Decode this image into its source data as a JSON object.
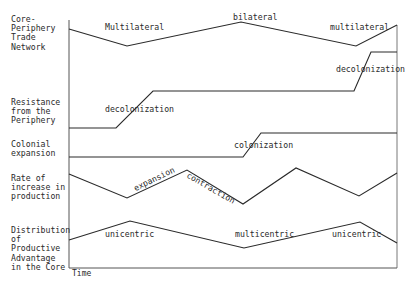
{
  "rows": [
    {
      "label": "Core-\nPeriphery\nTrade\nNetwork",
      "top": 15,
      "points": [
        [
          69,
          29
        ],
        [
          127,
          46
        ],
        [
          241,
          22
        ],
        [
          356,
          46
        ],
        [
          397,
          25
        ]
      ],
      "annotations": [
        {
          "text": "Multilateral",
          "x": 105,
          "y": 22,
          "rotate": 0
        },
        {
          "text": "bilateral",
          "x": 233,
          "y": 12,
          "rotate": 0
        },
        {
          "text": "multilateral",
          "x": 330,
          "y": 22,
          "rotate": 0
        }
      ]
    },
    {
      "label": "Resistance\nfrom the\nPeriphery",
      "top": 98,
      "points": [
        [
          69,
          128
        ],
        [
          116,
          128
        ],
        [
          153,
          91
        ],
        [
          354,
          91
        ],
        [
          371,
          52
        ],
        [
          397,
          52
        ]
      ],
      "annotations": [
        {
          "text": "decolonization",
          "x": 105,
          "y": 104,
          "rotate": 0
        },
        {
          "text": "decolonization",
          "x": 336,
          "y": 64,
          "rotate": 0
        }
      ]
    },
    {
      "label": "Colonial\nexpansion",
      "top": 140,
      "points": [
        [
          69,
          157
        ],
        [
          243,
          157
        ],
        [
          261,
          133
        ],
        [
          397,
          133
        ]
      ],
      "annotations": [
        {
          "text": "colonization",
          "x": 234,
          "y": 140,
          "rotate": 0
        }
      ]
    },
    {
      "label": "Rate of\nincrease in\nproduction",
      "top": 174,
      "points": [
        [
          69,
          174
        ],
        [
          127,
          198
        ],
        [
          187,
          170
        ],
        [
          243,
          204
        ],
        [
          296,
          168
        ],
        [
          359,
          196
        ],
        [
          397,
          173
        ]
      ],
      "annotations": [
        {
          "text": "expansion",
          "x": 132,
          "y": 184,
          "rotate": -26
        },
        {
          "text": "contraction",
          "x": 190,
          "y": 170,
          "rotate": 30
        }
      ]
    },
    {
      "label": "Distribution\nof\nProductive\nAdvantage\nin the Core",
      "top": 226,
      "points": [
        [
          69,
          240
        ],
        [
          130,
          221
        ],
        [
          244,
          248
        ],
        [
          360,
          222
        ],
        [
          397,
          243
        ]
      ],
      "annotations": [
        {
          "text": "unicentric",
          "x": 105,
          "y": 229,
          "rotate": 0
        },
        {
          "text": "multicentric",
          "x": 235,
          "y": 229,
          "rotate": 0
        },
        {
          "text": "unicentric",
          "x": 332,
          "y": 229,
          "rotate": 0
        }
      ]
    }
  ],
  "axis": {
    "x_label": "Time"
  },
  "colors": {
    "line": "#2a2a2a",
    "axis": "#555555"
  }
}
